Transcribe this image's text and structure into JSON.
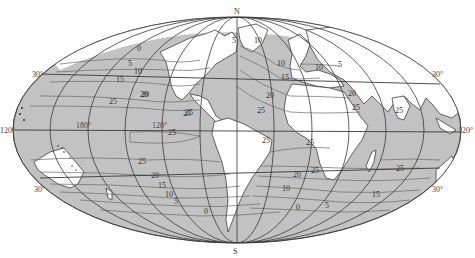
{
  "map": {
    "projection": "Mollweide (equal-area world)",
    "colors": {
      "ocean": "#c2c2c2",
      "land": "#ffffff",
      "grid": "#3a3a3a",
      "contour": "#6a6a6a",
      "coast": "#2a2a2a"
    },
    "pole_labels": {
      "north": "N",
      "south": "S"
    },
    "edge_labels": {
      "left_30n": "30°",
      "left_120": "120°",
      "left_30s": "30°",
      "right_30n": "30°",
      "right_120": "120°",
      "right_30s": "30°",
      "center_180": "180°",
      "center_120": "120°"
    },
    "contour_labels": [
      {
        "text": "5",
        "x": 128,
        "y": 66
      },
      {
        "text": "10",
        "x": 134,
        "y": 74
      },
      {
        "text": "15",
        "x": 116,
        "y": 82
      },
      {
        "text": "20",
        "x": 140,
        "y": 97
      },
      {
        "text": "25",
        "x": 109,
        "y": 104
      },
      {
        "text": "25",
        "x": 183,
        "y": 116
      },
      {
        "text": "20",
        "x": 141,
        "y": 97
      },
      {
        "text": "25",
        "x": 185,
        "y": 115
      },
      {
        "text": "0",
        "x": 137,
        "y": 51
      },
      {
        "text": "5",
        "x": 232,
        "y": 43
      },
      {
        "text": "10",
        "x": 254,
        "y": 43
      },
      {
        "text": "10",
        "x": 277,
        "y": 66
      },
      {
        "text": "15",
        "x": 281,
        "y": 80
      },
      {
        "text": "20",
        "x": 266,
        "y": 98
      },
      {
        "text": "25",
        "x": 257,
        "y": 113
      },
      {
        "text": "10",
        "x": 315,
        "y": 70
      },
      {
        "text": "5",
        "x": 338,
        "y": 67
      },
      {
        "text": "20",
        "x": 348,
        "y": 96
      },
      {
        "text": "25",
        "x": 352,
        "y": 110
      },
      {
        "text": "25",
        "x": 395,
        "y": 113
      },
      {
        "text": "25",
        "x": 168,
        "y": 135
      },
      {
        "text": "25",
        "x": 306,
        "y": 145
      },
      {
        "text": "25",
        "x": 311,
        "y": 173
      },
      {
        "text": "25",
        "x": 138,
        "y": 164
      },
      {
        "text": "20",
        "x": 151,
        "y": 178
      },
      {
        "text": "15",
        "x": 158,
        "y": 188
      },
      {
        "text": "10",
        "x": 165,
        "y": 197
      },
      {
        "text": "5",
        "x": 174,
        "y": 204
      },
      {
        "text": "0",
        "x": 204,
        "y": 214
      },
      {
        "text": "20",
        "x": 293,
        "y": 177
      },
      {
        "text": "10",
        "x": 282,
        "y": 191
      },
      {
        "text": "0",
        "x": 296,
        "y": 210
      },
      {
        "text": "5",
        "x": 325,
        "y": 208
      },
      {
        "text": "15",
        "x": 372,
        "y": 197
      },
      {
        "text": "25",
        "x": 396,
        "y": 171
      },
      {
        "text": "25",
        "x": 262,
        "y": 143
      }
    ]
  }
}
